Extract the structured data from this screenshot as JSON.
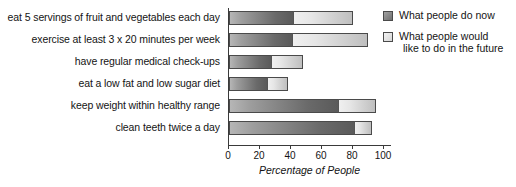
{
  "chart_data": {
    "type": "bar",
    "orientation": "horizontal",
    "stacked": true,
    "title": "",
    "xlabel": "Percentage of People",
    "ylabel": "",
    "xlim": [
      0,
      100
    ],
    "xticks": [
      0,
      20,
      40,
      60,
      80,
      100
    ],
    "grid": false,
    "legend_position": "right",
    "categories": [
      "eat 5 servings of fruit and vegetables each day",
      "exercise at least 3 x 20 minutes per week",
      "have regular medical check-ups",
      "eat a low fat and low sugar diet",
      "keep weight within healthy range",
      "clean teeth twice a day"
    ],
    "series": [
      {
        "name": "What people do now",
        "color": "#7a7a7a",
        "values": [
          42,
          41,
          28,
          25,
          71,
          81
        ]
      },
      {
        "name": "What people would like to do in the future",
        "color": "#dcdcdc",
        "values": [
          38,
          49,
          20,
          13,
          24,
          11
        ]
      }
    ],
    "cumulative_totals": [
      80,
      90,
      48,
      38,
      95,
      92
    ]
  },
  "axis": {
    "tick_labels": [
      "0",
      "20",
      "40",
      "60",
      "80",
      "100"
    ],
    "title": "Percentage of People"
  },
  "legend": {
    "items": [
      {
        "label": "What people do now",
        "label_line2": ""
      },
      {
        "label": "What people would",
        "label_line2": "like to do in the future"
      }
    ]
  }
}
